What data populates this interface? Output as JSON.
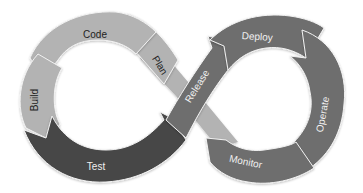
{
  "diagram": {
    "type": "devops-infinity-loop",
    "colors": {
      "light": "#b3b3b3",
      "medium": "#6e6e6e",
      "dark": "#474747",
      "divider": "#f2f2f2",
      "text_dark": "#222222",
      "text_light": "#f0f0f0"
    },
    "stages": [
      {
        "id": "plan",
        "label": "Plan"
      },
      {
        "id": "code",
        "label": "Code"
      },
      {
        "id": "build",
        "label": "Build"
      },
      {
        "id": "test",
        "label": "Test"
      },
      {
        "id": "release",
        "label": "Release"
      },
      {
        "id": "deploy",
        "label": "Deploy"
      },
      {
        "id": "operate",
        "label": "Operate"
      },
      {
        "id": "monitor",
        "label": "Monitor"
      }
    ]
  }
}
